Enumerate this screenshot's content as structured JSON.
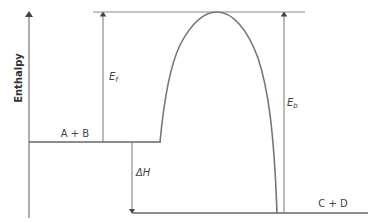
{
  "diagram": {
    "type": "energy-profile",
    "y_axis_label": "Enthalpy",
    "reactants_label": "A + B",
    "products_label": "C + D",
    "forward_activation": {
      "symbol": "E",
      "subscript": "f"
    },
    "backward_activation": {
      "symbol": "E",
      "subscript": "b"
    },
    "enthalpy_change": {
      "symbol": "ΔH"
    },
    "colors": {
      "line": "#6b6b6b",
      "curve": "#777777",
      "text": "#444444"
    }
  }
}
